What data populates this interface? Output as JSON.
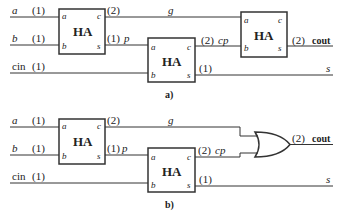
{
  "diagram_a": {
    "caption": "a)",
    "inputs": [
      {
        "name": "a",
        "delay": "(1)"
      },
      {
        "name": "b",
        "delay": "(1)"
      },
      {
        "name": "cin",
        "delay": "(1)"
      }
    ],
    "blocks": [
      {
        "label": "HA",
        "ports": {
          "in1": "a",
          "in2": "b",
          "out1": "c",
          "out2": "s"
        }
      },
      {
        "label": "HA",
        "ports": {
          "in1": "a",
          "in2": "b",
          "out1": "c",
          "out2": "s"
        }
      },
      {
        "label": "HA",
        "ports": {
          "in1": "a",
          "in2": "b",
          "out1": "c",
          "out2": "s"
        }
      }
    ],
    "signals": {
      "g_delay": "(2)",
      "g": "g",
      "p_delay": "(1)",
      "p": "p",
      "cp_delay": "(2)",
      "cp": "cp",
      "s_delay": "(1)",
      "s": "s",
      "cout_delay": "(2)",
      "cout": "cout"
    }
  },
  "diagram_b": {
    "caption": "b)",
    "inputs": [
      {
        "name": "a",
        "delay": "(1)"
      },
      {
        "name": "b",
        "delay": "(1)"
      },
      {
        "name": "cin",
        "delay": "(1)"
      }
    ],
    "blocks": [
      {
        "label": "HA",
        "ports": {
          "in1": "a",
          "in2": "b",
          "out1": "c",
          "out2": "s"
        }
      },
      {
        "label": "HA",
        "ports": {
          "in1": "a",
          "in2": "b",
          "out1": "c",
          "out2": "s"
        }
      }
    ],
    "gate": "OR",
    "signals": {
      "g_delay": "(2)",
      "g": "g",
      "p_delay": "(1)",
      "p": "p",
      "cp_delay": "(2)",
      "cp": "cp",
      "s_delay": "(1)",
      "s": "s",
      "cout_delay": "(2)",
      "cout": "cout"
    }
  }
}
